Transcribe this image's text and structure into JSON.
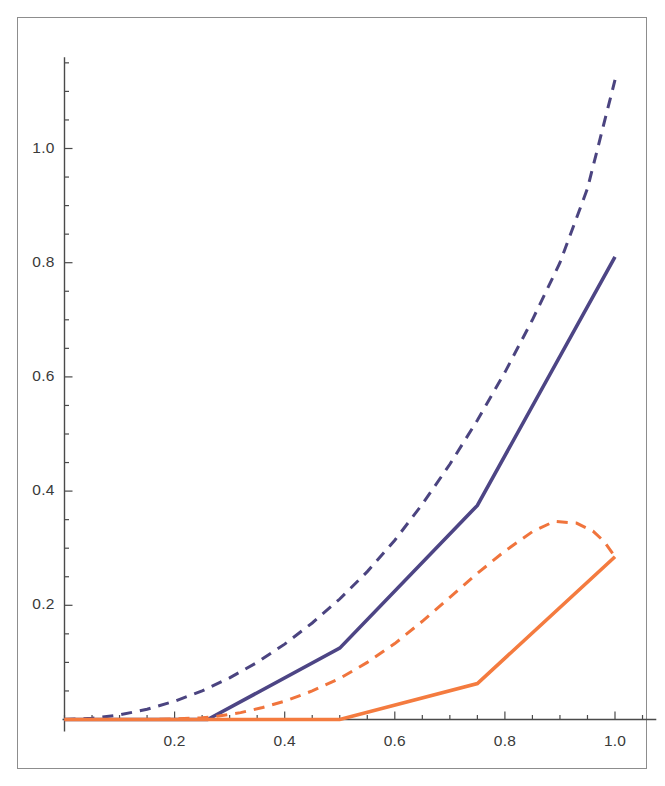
{
  "figure": {
    "title": "",
    "frame": {
      "visible": true,
      "color": "#8d8d8d"
    },
    "background": "#ffffff"
  },
  "axes": {
    "x": {
      "label": "",
      "tick_labels": [
        "0.2",
        "0.4",
        "0.6",
        "0.8",
        "1.0"
      ],
      "tick_values": [
        0.2,
        0.4,
        0.6,
        0.8,
        1.0
      ],
      "range": [
        0.0,
        1.075
      ],
      "axis_color": "#4a4a4a"
    },
    "y": {
      "label": "",
      "tick_labels": [
        "0.2",
        "0.4",
        "0.6",
        "0.8",
        "1.0"
      ],
      "tick_values": [
        0.2,
        0.4,
        0.6,
        0.8,
        1.0
      ],
      "range": [
        0.0,
        1.16
      ],
      "axis_color": "#4a4a4a"
    }
  },
  "colors": {
    "purple": "#4d4585",
    "purple_dashed": "#4b4480",
    "orange": "#f47b3f",
    "orange_dashed": "#f0743c",
    "axis": "#4a4a4a",
    "frame": "#8d8d8d",
    "text": "#3a3a3a"
  },
  "chart_data": {
    "type": "line",
    "title": "",
    "xlabel": "",
    "ylabel": "",
    "xlim": [
      0.0,
      1.075
    ],
    "ylim": [
      0.0,
      1.16
    ],
    "grid": false,
    "legend": "none",
    "xticks": [
      0.2,
      0.4,
      0.6,
      0.8,
      1.0
    ],
    "yticks": [
      0.2,
      0.4,
      0.6,
      0.8,
      1.0
    ],
    "series": [
      {
        "name": "purple-dashed-upper",
        "color": "#4b4480",
        "style": "dashed",
        "width": 3.0,
        "x": [
          0.0,
          0.05,
          0.1,
          0.15,
          0.2,
          0.25,
          0.3,
          0.35,
          0.4,
          0.45,
          0.5,
          0.55,
          0.6,
          0.65,
          0.7,
          0.75,
          0.8,
          0.85,
          0.9,
          0.95,
          1.0
        ],
        "y": [
          0.0,
          0.002,
          0.008,
          0.018,
          0.032,
          0.05,
          0.073,
          0.1,
          0.132,
          0.169,
          0.211,
          0.259,
          0.314,
          0.377,
          0.447,
          0.524,
          0.608,
          0.7,
          0.8,
          0.93,
          1.12
        ]
      },
      {
        "name": "purple-solid",
        "color": "#4d4585",
        "style": "solid",
        "width": 3.6,
        "x": [
          0.0,
          0.26,
          0.5,
          0.75,
          1.0
        ],
        "y": [
          0.0,
          0.0,
          0.125,
          0.375,
          0.81
        ]
      },
      {
        "name": "orange-dashed",
        "color": "#f0743c",
        "style": "dashed",
        "width": 3.0,
        "x": [
          0.0,
          0.05,
          0.1,
          0.15,
          0.2,
          0.25,
          0.28,
          0.32,
          0.36,
          0.4,
          0.45,
          0.5,
          0.55,
          0.6,
          0.65,
          0.7,
          0.75,
          0.8,
          0.85,
          0.89,
          0.93,
          0.96,
          0.98,
          1.0
        ],
        "y": [
          0.0,
          0.0,
          0.0,
          0.0,
          0.001,
          0.003,
          0.006,
          0.012,
          0.021,
          0.032,
          0.05,
          0.072,
          0.1,
          0.133,
          0.172,
          0.214,
          0.256,
          0.295,
          0.329,
          0.347,
          0.344,
          0.33,
          0.312,
          0.285
        ]
      },
      {
        "name": "orange-solid",
        "color": "#f47b3f",
        "style": "solid",
        "width": 3.6,
        "x": [
          0.0,
          0.5,
          0.75,
          1.0
        ],
        "y": [
          0.0,
          0.0,
          0.063,
          0.285
        ]
      }
    ]
  }
}
